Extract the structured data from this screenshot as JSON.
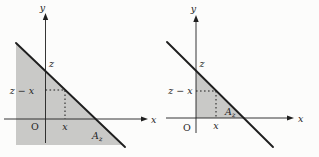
{
  "colors": {
    "bg": "#fcfcfb",
    "fill": "#c9c9c7",
    "line": "#1f1f1f",
    "text": "#1f1f1f"
  },
  "left_diagram": {
    "y_axis_label": "y",
    "x_axis_label": "x",
    "y_intercept_label": "z",
    "guide_y_label": "z − x",
    "guide_x_label": "x",
    "origin_label": "O",
    "area_label_base": "A",
    "area_label_sub": "z"
  },
  "right_diagram": {
    "y_axis_label": "y",
    "x_axis_label": "x",
    "y_intercept_label": "z",
    "guide_y_label": "z − x",
    "guide_x_label": "x",
    "origin_label": "O",
    "area_label_base": "A",
    "area_label_sub": "z"
  }
}
